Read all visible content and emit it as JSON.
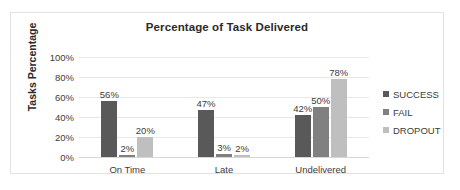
{
  "chart_data": {
    "type": "bar",
    "title": "Percentage of Task Delivered",
    "xlabel": "",
    "ylabel": "Tasks Percentage",
    "categories": [
      "On Time",
      "Late",
      "Undelivered"
    ],
    "series": [
      {
        "name": "SUCCESS",
        "color": "#595959",
        "values": [
          56,
          47,
          42
        ],
        "labels": [
          "56%",
          "47%",
          "42%"
        ]
      },
      {
        "name": "FAIL",
        "color": "#808080",
        "values": [
          2,
          3,
          50
        ],
        "labels": [
          "2%",
          "3%",
          "50%"
        ]
      },
      {
        "name": "DROPOUT",
        "color": "#bfbfbf",
        "values": [
          20,
          2,
          78
        ],
        "labels": [
          "20%",
          "2%",
          "78%"
        ]
      }
    ],
    "grouped_values": [
      {
        "category": "On Time",
        "SUCCESS": 56,
        "FAIL": 47,
        "DROPOUT": 20
      },
      {
        "category": "Late",
        "SUCCESS": 2,
        "FAIL": 3,
        "DROPOUT": 2
      },
      {
        "category": "Undelivered",
        "SUCCESS": 42,
        "FAIL": 50,
        "DROPOUT": 78
      }
    ],
    "ylim": [
      0,
      100
    ],
    "ytick_labels": [
      "100%",
      "80%",
      "60%",
      "40%",
      "20%",
      "0%"
    ],
    "ytick_values": [
      100,
      80,
      60,
      40,
      20,
      0
    ],
    "grid": true,
    "legend_position": "right"
  },
  "legend": {
    "items": [
      {
        "label": "SUCCESS",
        "color": "#595959"
      },
      {
        "label": "FAIL",
        "color": "#808080"
      },
      {
        "label": "DROPOUT",
        "color": "#bfbfbf"
      }
    ]
  }
}
